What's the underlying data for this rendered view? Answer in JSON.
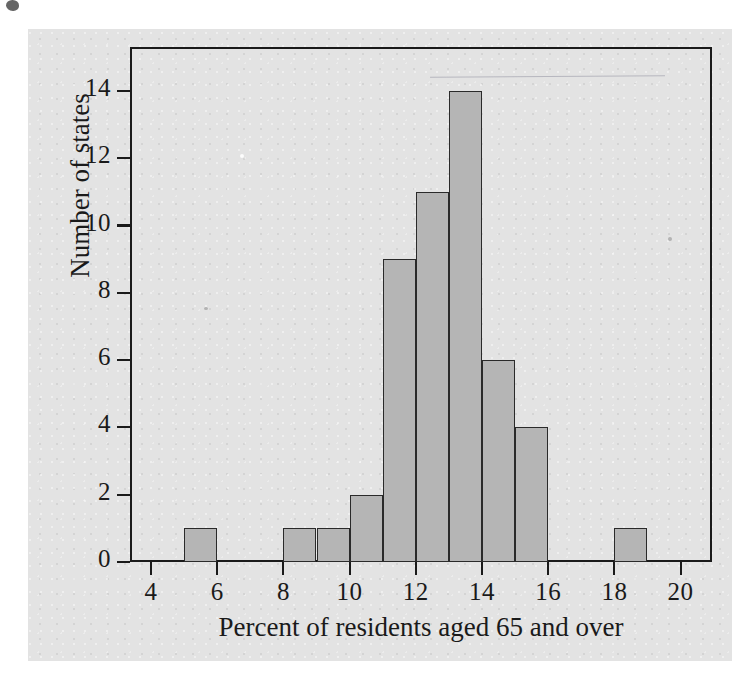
{
  "figure": {
    "background_color": "#e3e3e3",
    "bar_fill_color": "#b5b5b5",
    "bar_edge_color": "#2a2a2a",
    "axis_color": "#1a1a1a"
  },
  "chart_data": {
    "type": "bar",
    "title": "",
    "xlabel": "Percent of residents aged 65 and over",
    "ylabel": "Number of states",
    "xlim": [
      3.5,
      20.5
    ],
    "ylim": [
      0,
      15
    ],
    "xticks": [
      4,
      6,
      8,
      10,
      12,
      14,
      16,
      18,
      20
    ],
    "xticklabels": [
      "4",
      "6",
      "8",
      "10",
      "12",
      "14",
      "16",
      "18",
      "20"
    ],
    "yticks": [
      0,
      2,
      4,
      6,
      8,
      10,
      12,
      14
    ],
    "yticklabels": [
      "0",
      "2",
      "4",
      "6",
      "8",
      "10",
      "12",
      "14"
    ],
    "grid": false,
    "legend": null,
    "bin_width": 1,
    "bins": [
      {
        "left": 4,
        "right": 5,
        "count": 0
      },
      {
        "left": 5,
        "right": 6,
        "count": 1
      },
      {
        "left": 6,
        "right": 7,
        "count": 0
      },
      {
        "left": 7,
        "right": 8,
        "count": 0
      },
      {
        "left": 8,
        "right": 9,
        "count": 1
      },
      {
        "left": 9,
        "right": 10,
        "count": 1
      },
      {
        "left": 10,
        "right": 11,
        "count": 2
      },
      {
        "left": 11,
        "right": 12,
        "count": 9
      },
      {
        "left": 12,
        "right": 13,
        "count": 11
      },
      {
        "left": 13,
        "right": 14,
        "count": 14
      },
      {
        "left": 14,
        "right": 15,
        "count": 6
      },
      {
        "left": 15,
        "right": 16,
        "count": 4
      },
      {
        "left": 16,
        "right": 17,
        "count": 0
      },
      {
        "left": 17,
        "right": 18,
        "count": 0
      },
      {
        "left": 18,
        "right": 19,
        "count": 1
      },
      {
        "left": 19,
        "right": 20,
        "count": 0
      }
    ],
    "categories": [
      "5-6",
      "8-9",
      "9-10",
      "10-11",
      "11-12",
      "12-13",
      "13-14",
      "14-15",
      "15-16",
      "18-19"
    ],
    "values": [
      1,
      1,
      1,
      2,
      9,
      11,
      14,
      6,
      4,
      1
    ],
    "total_count": 51
  }
}
